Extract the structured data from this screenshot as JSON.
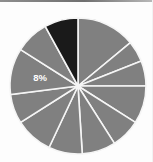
{
  "figure": {
    "title": "",
    "background_color": "#fdfdfd"
  },
  "colors": {
    "slice_default": "#808080",
    "slice_highlight": "#1a1a1a",
    "slice_border": "#f5f5f5",
    "label_text": "#ffffff",
    "top_rule": "#6f6f6f"
  },
  "geometry": {
    "center_x": 78,
    "center_y": 86,
    "radius": 68
  },
  "label": {
    "text": "8%",
    "x": 40,
    "y": 78
  },
  "chart_data": {
    "type": "pie",
    "title": "",
    "xlabel": "",
    "ylabel": "",
    "legend": "none",
    "grid": false,
    "labels": [
      "",
      "",
      "",
      "",
      "",
      "",
      "",
      "",
      "",
      "",
      "",
      ""
    ],
    "values": [
      14,
      5,
      6,
      9,
      7,
      8,
      8,
      9,
      7,
      11,
      8,
      8
    ],
    "data_labels": [
      "",
      "",
      "",
      "",
      "",
      "",
      "",
      "",
      "",
      "",
      "",
      "8%"
    ],
    "highlighted_index": 11,
    "highlighted_value": 8,
    "start_angle_deg": -90,
    "direction": "clockwise",
    "slice_colors": [
      "#808080",
      "#808080",
      "#808080",
      "#808080",
      "#808080",
      "#808080",
      "#808080",
      "#808080",
      "#808080",
      "#808080",
      "#808080",
      "#1a1a1a"
    ]
  }
}
